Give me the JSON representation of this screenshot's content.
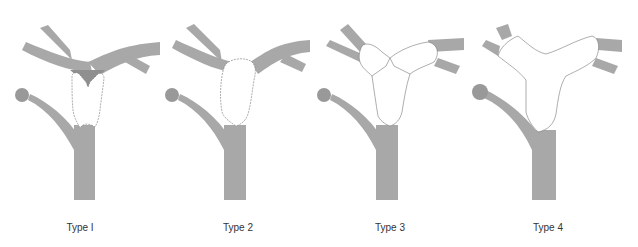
{
  "figure": {
    "panels": [
      {
        "label": "Type I"
      },
      {
        "label": "Type 2"
      },
      {
        "label": "Type 3"
      },
      {
        "label": "Type 4"
      }
    ]
  },
  "colors": {
    "vessel": "#a8a8a8",
    "vessel_dark": "#8f8f8f",
    "lesion": "#ffffff",
    "outline": "#777777"
  }
}
